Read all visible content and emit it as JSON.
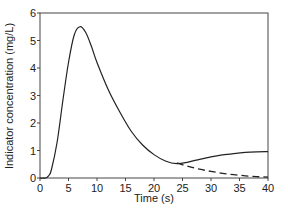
{
  "chart_data": {
    "type": "line",
    "title": "",
    "xlabel": "Time (s)",
    "ylabel": "Indicator concentration (mg/L)",
    "xlim": [
      0,
      40
    ],
    "ylim": [
      0,
      6
    ],
    "xticks": [
      0,
      5,
      10,
      15,
      20,
      25,
      30,
      35,
      40
    ],
    "yticks": [
      0,
      1,
      2,
      3,
      4,
      5,
      6
    ],
    "grid": false,
    "legend": null,
    "series": [
      {
        "name": "Measured indicator concentration",
        "style": "solid",
        "color": "#222222",
        "x": [
          0,
          1,
          1.5,
          2,
          3,
          4,
          5,
          6,
          7,
          8,
          9,
          10,
          12,
          14,
          16,
          18,
          20,
          22,
          24,
          26,
          28,
          30,
          32,
          34,
          36,
          38,
          40
        ],
        "y": [
          0,
          0,
          0.08,
          0.3,
          1.3,
          2.8,
          4.2,
          5.2,
          5.5,
          5.3,
          4.8,
          4.2,
          3.2,
          2.4,
          1.7,
          1.2,
          0.85,
          0.62,
          0.52,
          0.58,
          0.68,
          0.77,
          0.84,
          0.89,
          0.93,
          0.95,
          0.96
        ]
      },
      {
        "name": "Extrapolated decay (recirculation excluded)",
        "style": "dashed",
        "color": "#222222",
        "x": [
          24,
          26,
          28,
          30,
          32,
          34,
          36,
          38,
          40
        ],
        "y": [
          0.55,
          0.42,
          0.32,
          0.24,
          0.17,
          0.12,
          0.08,
          0.05,
          0.03
        ]
      }
    ]
  }
}
